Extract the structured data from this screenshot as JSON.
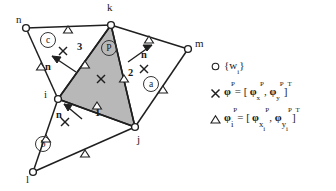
{
  "figure": {
    "kind": "finite-element-patch-diagram",
    "nodes": [
      {
        "id": "n",
        "label": "n",
        "x": 26,
        "y": 28,
        "label_x": 18,
        "label_y": 16
      },
      {
        "id": "k",
        "label": "k",
        "x": 111,
        "y": 25,
        "label_x": 108,
        "label_y": 4
      },
      {
        "id": "m",
        "label": "m",
        "x": 188,
        "y": 49,
        "label_x": 196,
        "label_y": 40
      },
      {
        "id": "i",
        "label": "i",
        "x": 58,
        "y": 99,
        "label_x": 45,
        "label_y": 90
      },
      {
        "id": "j",
        "label": "j",
        "x": 135,
        "y": 127,
        "label_x": 138,
        "label_y": 136
      },
      {
        "id": "l",
        "label": "l",
        "x": 33,
        "y": 172,
        "label_x": 27,
        "label_y": 176
      }
    ],
    "elements": [
      {
        "id": "P",
        "label": "P",
        "circled": true,
        "label_x": 108,
        "label_y": 47,
        "shaded": true
      },
      {
        "id": "a",
        "label": "a",
        "circled": true,
        "label_x": 150,
        "label_y": 76
      },
      {
        "id": "b",
        "label": "b",
        "circled": true,
        "label_x": 42,
        "label_y": 139
      },
      {
        "id": "c",
        "label": "c",
        "circled": true,
        "label_x": 47,
        "label_y": 39
      }
    ],
    "edge_numbers": [
      {
        "label": "1",
        "x": 98,
        "y": 113
      },
      {
        "label": "2",
        "x": 125,
        "y": 72
      },
      {
        "label": "3",
        "x": 81,
        "y": 47
      }
    ],
    "normals": [
      {
        "label": "n",
        "x": 49,
        "y": 64
      },
      {
        "label": "n",
        "x": 143,
        "y": 55
      },
      {
        "label": "n",
        "x": 61,
        "y": 113
      }
    ]
  },
  "legend": {
    "rows": [
      {
        "glyph": "circle-marker",
        "glyph_char": "○",
        "text": "{w_i}"
      },
      {
        "glyph": "cross-marker",
        "glyph_char": "×",
        "text": "φ^P = [ φ_x^P , φ_y^P ]^T"
      },
      {
        "glyph": "triangle-marker",
        "glyph_char": "△",
        "text": "φ_i^P = [ φ_{x_i}^P , φ_{y_i}^P ]^T"
      }
    ]
  },
  "colors": {
    "line": "#1f1f1f",
    "shade": "#b5b5b5",
    "marker_fill": "#ffffff",
    "text": "#1a1a1a"
  }
}
